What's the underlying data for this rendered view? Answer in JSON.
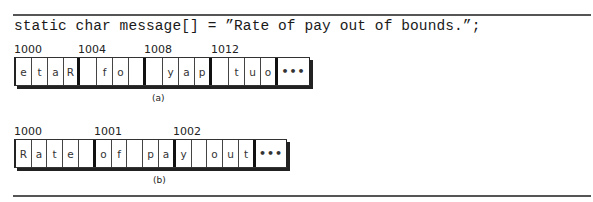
{
  "code_line": "static char message[] = ”Rate of pay out of bounds.”;",
  "diagram_a": {
    "caption": "(a)",
    "addresses": [
      "1000",
      "1004",
      "1008",
      "1012"
    ],
    "cells": [
      "e",
      "t",
      "a",
      "R",
      " ",
      "f",
      "o",
      " ",
      " ",
      "y",
      "a",
      "p",
      " ",
      "t",
      "u",
      "o"
    ],
    "continuation": "•••",
    "group_size": 4
  },
  "diagram_b": {
    "caption": "(b)",
    "addresses": [
      "1000",
      "1001",
      "1002"
    ],
    "cells": [
      "R",
      "a",
      "t",
      "e",
      " ",
      "o",
      "f",
      " ",
      "p",
      "a",
      "y",
      " ",
      "o",
      "u",
      "t"
    ],
    "continuation": "•••",
    "group_size": 5
  }
}
